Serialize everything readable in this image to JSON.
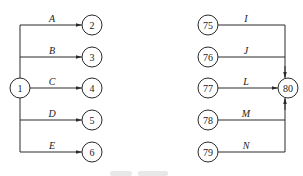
{
  "diagram": {
    "type": "activity-network",
    "colors": {
      "stroke": "#2a2a2a",
      "text": "#1a1a1a",
      "background": "#ffffff"
    },
    "left": {
      "source": {
        "id": "1",
        "x": 20,
        "y": 88
      },
      "targets": [
        {
          "id": "2",
          "edge": "A",
          "x": 92,
          "y": 25
        },
        {
          "id": "3",
          "edge": "B",
          "x": 92,
          "y": 57
        },
        {
          "id": "4",
          "edge": "C",
          "x": 92,
          "y": 88
        },
        {
          "id": "5",
          "edge": "D",
          "x": 92,
          "y": 120
        },
        {
          "id": "6",
          "edge": "E",
          "x": 92,
          "y": 152
        }
      ]
    },
    "right": {
      "sink": {
        "id": "80",
        "x": 288,
        "y": 88
      },
      "sources": [
        {
          "id": "75",
          "edge": "I",
          "x": 208,
          "y": 25
        },
        {
          "id": "76",
          "edge": "J",
          "x": 208,
          "y": 57
        },
        {
          "id": "77",
          "edge": "L",
          "x": 208,
          "y": 88
        },
        {
          "id": "78",
          "edge": "M",
          "x": 208,
          "y": 120
        },
        {
          "id": "79",
          "edge": "N",
          "x": 208,
          "y": 152
        }
      ]
    }
  },
  "caption": {
    "visible": "partial-cropped"
  }
}
